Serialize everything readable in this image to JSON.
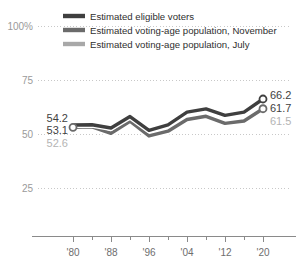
{
  "chart_data": {
    "type": "line",
    "title": "",
    "subtitle": "",
    "xlabel": "",
    "ylabel": "",
    "xlim": [
      1980,
      2020
    ],
    "ylim": [
      0,
      100
    ],
    "yticks": [
      "25",
      "50",
      "75",
      "100%"
    ],
    "ytick_values": [
      25,
      50,
      75,
      100
    ],
    "xticks": [
      "'80",
      "'88",
      "'96",
      "'04",
      "'12",
      "'20"
    ],
    "xtick_values": [
      1980,
      1988,
      1996,
      2004,
      2012,
      2020
    ],
    "grid": "horizontal-dotted",
    "legend_position": "top",
    "x": [
      1980,
      1984,
      1988,
      1992,
      1996,
      2000,
      2004,
      2008,
      2012,
      2016,
      2020
    ],
    "series": [
      {
        "name": "Estimated eligible voters",
        "color": "#3f3f3f",
        "values": [
          54.2,
          54.3,
          52.8,
          58.1,
          51.7,
          54.2,
          60.1,
          61.6,
          58.6,
          60.1,
          66.2
        ],
        "start_label": "54.2",
        "end_label": "66.2",
        "end_marker": "open-circle"
      },
      {
        "name": "Estimated voting-age population, November",
        "color": "#6b6b6b",
        "values": [
          53.1,
          53.3,
          50.3,
          55.9,
          49.1,
          51.3,
          56.7,
          58.2,
          54.9,
          56.0,
          61.7
        ],
        "start_label": "53.1",
        "end_label": "61.7",
        "start_marker": "open-circle",
        "end_marker": "open-circle"
      },
      {
        "name": "Estimated voting-age population, July",
        "color": "#a8a8a8",
        "values": [
          52.6,
          52.9,
          50.1,
          55.6,
          48.9,
          51.0,
          56.4,
          57.9,
          54.6,
          55.7,
          61.5
        ],
        "start_label": "52.6",
        "end_label": "61.5"
      }
    ]
  },
  "legend": {
    "items": [
      {
        "label": "Estimated eligible voters",
        "color": "#3f3f3f"
      },
      {
        "label": "Estimated voting-age population, November",
        "color": "#6b6b6b"
      },
      {
        "label": "Estimated voting-age population, July",
        "color": "#a8a8a8"
      }
    ]
  },
  "axis": {
    "y_labels": [
      "100%",
      "75",
      "50",
      "25"
    ],
    "x_labels": [
      "'80",
      "'88",
      "'96",
      "'04",
      "'12",
      "'20"
    ]
  },
  "annotations": {
    "left": [
      {
        "text": "54.2",
        "color": "#3f3f3f"
      },
      {
        "text": "53.1",
        "color": "#3f3f3f"
      },
      {
        "text": "52.6",
        "color": "#b4b4b4"
      }
    ],
    "right": [
      {
        "text": "66.2",
        "color": "#3f3f3f"
      },
      {
        "text": "61.7",
        "color": "#3f3f3f"
      },
      {
        "text": "61.5",
        "color": "#b4b4b4"
      }
    ]
  },
  "colors": {
    "series_dark": "#3f3f3f",
    "series_mid": "#6b6b6b",
    "series_light": "#a8a8a8",
    "grid": "#c8c8c8",
    "axis": "#8a8a8a",
    "tick_text": "#6e6e6e",
    "ytick_text": "#9a9a9a",
    "background": "#ffffff"
  }
}
